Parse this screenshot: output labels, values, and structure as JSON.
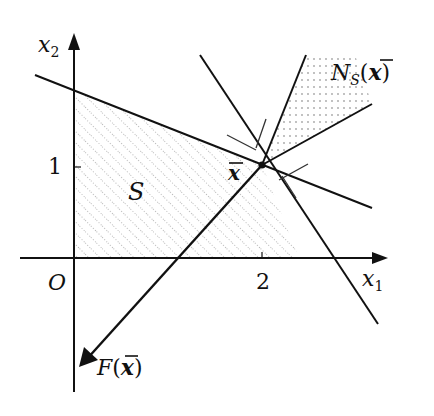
{
  "figure": {
    "type": "normal-cone-variational-inequality",
    "colors": {
      "stroke": "#111111",
      "background": "#ffffff",
      "hatch": "#555555"
    }
  },
  "axes": {
    "x_label": "x",
    "x_label_sub": "1",
    "y_label": "x",
    "y_label_sub": "2",
    "origin_label": "O",
    "x_tick_label": "2",
    "y_tick_label": "1"
  },
  "labels": {
    "set": "S",
    "point": "x",
    "normal_cone_main": "N",
    "normal_cone_sub": "S",
    "normal_cone_arg_open": "(",
    "normal_cone_arg": "x",
    "normal_cone_arg_close": ")",
    "field_main": "F",
    "field_arg_open": "(",
    "field_arg": "x",
    "field_arg_close": ")"
  }
}
